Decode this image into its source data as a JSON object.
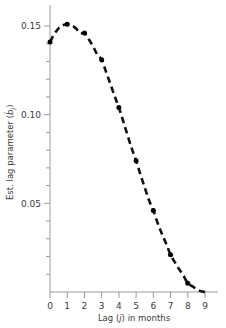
{
  "figure": {
    "background_color": "#ffffff",
    "axis_color": "#9a9a9a",
    "curve_color": "#111111",
    "marker_color": "#000000"
  },
  "chart_data": {
    "type": "scatter",
    "title": "",
    "subtitle": "",
    "xlabel": "Lag (j) in months",
    "ylabel": "Est. lag parameter (b̂ⱼ)",
    "ylabel_parts": {
      "prefix": "Est. lag parameter (",
      "symbol": "b",
      "hat": "̂",
      "subscript": "j",
      "suffix": ")"
    },
    "xlabel_parts": {
      "prefix": "Lag (",
      "symbol": "j",
      "suffix": ") in months"
    },
    "x": [
      0,
      1,
      2,
      3,
      4,
      5,
      6,
      7,
      8
    ],
    "values": [
      0.141,
      0.151,
      0.146,
      0.131,
      0.104,
      0.074,
      0.046,
      0.021,
      0.005
    ],
    "series": [
      {
        "name": "Estimated lag distribution",
        "values": [
          0.141,
          0.151,
          0.146,
          0.131,
          0.104,
          0.074,
          0.046,
          0.021,
          0.005
        ],
        "marker": "filled-circle",
        "line_style": "dashed"
      }
    ],
    "fitted_curve": {
      "style": "dashed",
      "x_start": 0.0,
      "x_end": 9.0,
      "points": [
        [
          0.0,
          0.141
        ],
        [
          0.25,
          0.1455
        ],
        [
          0.5,
          0.1487
        ],
        [
          0.75,
          0.1504
        ],
        [
          1.0,
          0.151
        ],
        [
          1.25,
          0.1503
        ],
        [
          1.5,
          0.1487
        ],
        [
          1.75,
          0.1459
        ],
        [
          2.0,
          0.146
        ],
        [
          2.25,
          0.1425
        ],
        [
          2.5,
          0.1385
        ],
        [
          2.75,
          0.1338
        ],
        [
          3.0,
          0.131
        ],
        [
          3.25,
          0.1243
        ],
        [
          3.5,
          0.1175
        ],
        [
          3.75,
          0.1105
        ],
        [
          4.0,
          0.104
        ],
        [
          4.25,
          0.0963
        ],
        [
          4.5,
          0.0885
        ],
        [
          4.75,
          0.0808
        ],
        [
          5.0,
          0.074
        ],
        [
          5.25,
          0.0663
        ],
        [
          5.5,
          0.0589
        ],
        [
          5.75,
          0.0517
        ],
        [
          6.0,
          0.046
        ],
        [
          6.25,
          0.0389
        ],
        [
          6.5,
          0.0327
        ],
        [
          6.75,
          0.0271
        ],
        [
          7.0,
          0.021
        ],
        [
          7.25,
          0.0168
        ],
        [
          7.5,
          0.0128
        ],
        [
          7.75,
          0.0092
        ],
        [
          8.0,
          0.005
        ],
        [
          8.25,
          0.0033
        ],
        [
          8.5,
          0.0017
        ],
        [
          8.75,
          0.0005
        ],
        [
          9.0,
          0.0
        ]
      ]
    },
    "xlim": [
      0,
      9
    ],
    "ylim": [
      0,
      0.1595
    ],
    "xticks": [
      0,
      1,
      2,
      3,
      4,
      5,
      6,
      7,
      8,
      9
    ],
    "xticklabels": [
      "0",
      "1",
      "2",
      "3",
      "4",
      "5",
      "6",
      "7",
      "8",
      "9"
    ],
    "yticks_major": [
      0.05,
      0.1,
      0.15
    ],
    "yticklabels": [
      "0.05",
      "0.10",
      "0.15"
    ],
    "yticks_minor": [
      0.01,
      0.02,
      0.03,
      0.04,
      0.06,
      0.07,
      0.08,
      0.09,
      0.11,
      0.12,
      0.13,
      0.14
    ],
    "grid": false,
    "legend": null,
    "annotations": []
  }
}
